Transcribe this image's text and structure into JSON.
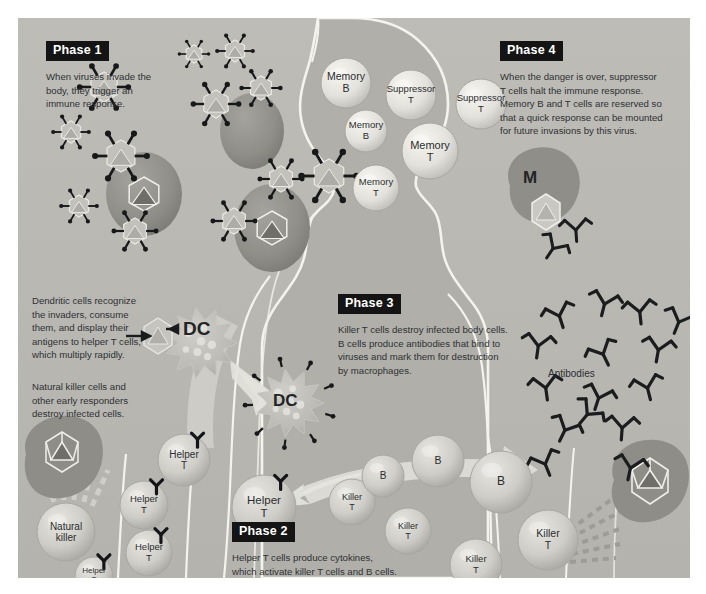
{
  "diagram": {
    "background_color": "#b9b8b3",
    "page_color": "#ffffff",
    "badge_bg": "#141414",
    "badge_fg": "#ffffff",
    "text_color": "#2f3133",
    "body_fill": "#b2b1ab",
    "body_outline": "#f2f1ec",
    "cell_fill": "#c9c8c2",
    "memory_fill": "#e4e3dd",
    "infected_fill": "#8e8d87",
    "virus_fill": "#c2c1bb",
    "arrow_fill": "#e0dfd9",
    "antibody_color": "#1b1c1e"
  },
  "phases": [
    {
      "id": "phase-1",
      "label": "Phase 1",
      "text": "When viruses invade the\nbody, they trigger an\nimmune response."
    },
    {
      "id": "phase-2",
      "label": "Phase 2",
      "text": "Helper T cells produce cytokines,\nwhich activate killer T cells and B cells."
    },
    {
      "id": "phase-3",
      "label": "Phase 3",
      "text": "Killer T cells destroy infected body cells.\nB cells produce antibodies that bind to\nviruses and mark them for destruction\nby macrophages."
    },
    {
      "id": "phase-4",
      "label": "Phase 4",
      "text": "When the danger is over, suppressor\nT cells halt the immune response.\nMemory B and T cells are reserved so\nthat a quick response can be mounted\nfor future invasions by this virus."
    }
  ],
  "annotations": {
    "dendritic": "Dendritic cells recognize\nthe invaders, consume\nthem, and display their\nantigens to helper T cells,\nwhich multiply rapidly.",
    "natural_killer_note": "Natural killer cells and\nother early responders\ndestroy infected cells.",
    "antibodies_label": "Antibodies",
    "dc_label_1": "DC",
    "dc_label_2": "DC",
    "macrophage_label": "M"
  },
  "cells": [
    {
      "id": "memory-b-1",
      "name": "Memory B",
      "line1": "Memory",
      "line2": "B",
      "x": 328,
      "y": 65,
      "r": 25,
      "font": 10.5,
      "type": "memory"
    },
    {
      "id": "memory-b-2",
      "name": "Memory B",
      "line1": "Memory",
      "line2": "B",
      "x": 348,
      "y": 113,
      "r": 21,
      "font": 9.5,
      "type": "memory"
    },
    {
      "id": "memory-t-1",
      "name": "Memory T",
      "line1": "Memory",
      "line2": "T",
      "x": 358,
      "y": 170,
      "r": 23,
      "font": 9.5,
      "type": "memory"
    },
    {
      "id": "memory-t-2",
      "name": "Memory T",
      "line1": "Memory",
      "line2": "T",
      "x": 412,
      "y": 133,
      "r": 28,
      "font": 11,
      "type": "memory"
    },
    {
      "id": "suppressor-t-1",
      "name": "Suppressor T",
      "line1": "Suppressor",
      "line2": "T",
      "x": 393,
      "y": 77,
      "r": 25,
      "font": 9.5,
      "type": "memory"
    },
    {
      "id": "suppressor-t-2",
      "name": "Suppressor T",
      "line1": "Suppressor",
      "line2": "T",
      "x": 463,
      "y": 86,
      "r": 25,
      "font": 9.5,
      "type": "memory"
    },
    {
      "id": "natural-killer",
      "name": "Natural killer",
      "line1": "Natural",
      "line2": "killer",
      "x": 48,
      "y": 514,
      "r": 29,
      "font": 10,
      "type": "plain"
    },
    {
      "id": "helper-t-1",
      "name": "Helper T",
      "line1": "Helper",
      "line2": "T",
      "x": 166,
      "y": 442,
      "r": 26,
      "font": 10,
      "type": "receptor"
    },
    {
      "id": "helper-t-2",
      "name": "Helper T",
      "line1": "Helper",
      "line2": "T",
      "x": 126,
      "y": 487,
      "r": 24,
      "font": 9.5,
      "type": "receptor"
    },
    {
      "id": "helper-t-3",
      "name": "Helper T",
      "line1": "Helper",
      "line2": "T",
      "x": 131,
      "y": 535,
      "r": 23,
      "font": 9.5,
      "type": "receptor"
    },
    {
      "id": "helper-t-4",
      "name": "Helper T",
      "line1": "Helper",
      "line2": "T",
      "x": 76,
      "y": 558,
      "r": 19,
      "font": 8,
      "type": "receptor"
    },
    {
      "id": "helper-t-5",
      "name": "Helper T",
      "line1": "Helper",
      "line2": "T",
      "x": 246,
      "y": 489,
      "r": 32,
      "font": 11.5,
      "type": "receptor"
    },
    {
      "id": "killer-t-1",
      "name": "Killer T",
      "line1": "Killer",
      "line2": "T",
      "x": 334,
      "y": 484,
      "r": 23,
      "font": 9,
      "type": "plain"
    },
    {
      "id": "killer-t-2",
      "name": "Killer T",
      "line1": "Killer",
      "line2": "T",
      "x": 390,
      "y": 513,
      "r": 23,
      "font": 9,
      "type": "plain"
    },
    {
      "id": "killer-t-3",
      "name": "Killer T",
      "line1": "Killer",
      "line2": "T",
      "x": 458,
      "y": 547,
      "r": 26,
      "font": 9.5,
      "type": "plain"
    },
    {
      "id": "killer-t-4",
      "name": "Killer T",
      "line1": "Killer",
      "line2": "T",
      "x": 530,
      "y": 522,
      "r": 30,
      "font": 10.5,
      "type": "plain"
    },
    {
      "id": "b-cell-1",
      "name": "B cell",
      "line1": "B",
      "line2": "",
      "x": 365,
      "y": 458,
      "r": 21,
      "font": 10,
      "type": "plain"
    },
    {
      "id": "b-cell-2",
      "name": "B cell",
      "line1": "B",
      "line2": "",
      "x": 420,
      "y": 443,
      "r": 26,
      "font": 10.5,
      "type": "plain"
    },
    {
      "id": "b-cell-3",
      "name": "B cell",
      "line1": "B",
      "line2": "",
      "x": 483,
      "y": 464,
      "r": 31,
      "font": 12,
      "type": "plain"
    }
  ],
  "viruses": [
    {
      "id": "virus-1",
      "x": 86,
      "y": 69,
      "r": 15
    },
    {
      "id": "virus-2",
      "x": 53,
      "y": 114,
      "r": 11
    },
    {
      "id": "virus-3",
      "x": 176,
      "y": 36,
      "r": 9
    },
    {
      "id": "virus-4",
      "x": 217,
      "y": 33,
      "r": 11
    },
    {
      "id": "virus-5",
      "x": 243,
      "y": 70,
      "r": 12
    },
    {
      "id": "virus-6",
      "x": 198,
      "y": 86,
      "r": 14
    },
    {
      "id": "virus-7",
      "x": 103,
      "y": 138,
      "r": 16
    },
    {
      "id": "virus-8",
      "x": 61,
      "y": 188,
      "r": 11
    },
    {
      "id": "virus-9",
      "x": 117,
      "y": 213,
      "r": 13
    },
    {
      "id": "virus-10",
      "x": 216,
      "y": 203,
      "r": 13
    },
    {
      "id": "virus-11",
      "x": 263,
      "y": 161,
      "r": 13
    },
    {
      "id": "virus-12",
      "x": 311,
      "y": 158,
      "r": 17
    }
  ],
  "infected_cells": [
    {
      "id": "infected-1",
      "x": 126,
      "y": 176,
      "rx": 38,
      "ry": 42,
      "core": true
    },
    {
      "id": "infected-2",
      "x": 234,
      "y": 113,
      "rx": 32,
      "ry": 38,
      "core": false
    },
    {
      "id": "infected-3",
      "x": 254,
      "y": 210,
      "rx": 38,
      "ry": 44,
      "core": true
    }
  ],
  "dendritic_cells": [
    {
      "id": "dendritic-1",
      "x": 183,
      "y": 325,
      "r": 36
    },
    {
      "id": "dendritic-2",
      "x": 272,
      "y": 385,
      "r": 34
    }
  ]
}
